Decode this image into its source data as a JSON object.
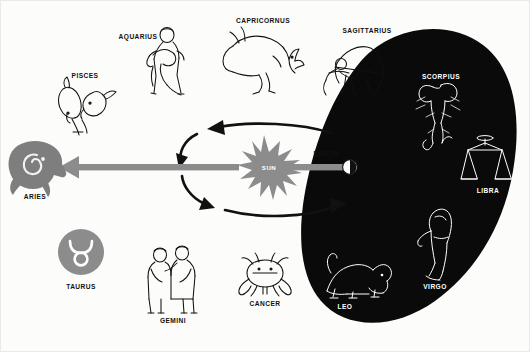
{
  "diagram": {
    "background_color": "#fcfcfb",
    "ink_color": "#111111",
    "accent_gray": "#8c8c8c",
    "night_region_color": "#0a0a0a"
  },
  "center": {
    "sun_label": "SUN",
    "earth_label": "EARTH",
    "sun_color": "#8c8c8c",
    "earth_color_lit": "#ffffff",
    "earth_color_dark": "#111111",
    "sightline_color": "#8c8c8c"
  },
  "night_side": {
    "name": "night-sky-region",
    "fill": "#0a0a0a",
    "label_color": "#ffffff"
  },
  "signs": [
    {
      "id": "aries",
      "label": "ARIES",
      "style": "gray-silhouette",
      "depicts": "ram",
      "region": "day"
    },
    {
      "id": "pisces",
      "label": "PISCES",
      "style": "line-art",
      "depicts": "two-fishes",
      "region": "day"
    },
    {
      "id": "aquarius",
      "label": "AQUARIUS",
      "style": "line-art",
      "depicts": "water-bearer",
      "region": "day"
    },
    {
      "id": "capricornus",
      "label": "CAPRICORNUS",
      "style": "line-art",
      "depicts": "sea-goat",
      "region": "day"
    },
    {
      "id": "sagittarius",
      "label": "SAGITTARIUS",
      "style": "line-art",
      "depicts": "archer",
      "region": "day"
    },
    {
      "id": "scorpius",
      "label": "SCORPIUS",
      "style": "white-line-art",
      "depicts": "scorpion",
      "region": "night"
    },
    {
      "id": "libra",
      "label": "LIBRA",
      "style": "white-line-art",
      "depicts": "scales",
      "region": "night"
    },
    {
      "id": "virgo",
      "label": "VIRGO",
      "style": "white-line-art",
      "depicts": "maiden",
      "region": "night"
    },
    {
      "id": "leo",
      "label": "LEO",
      "style": "white-line-art",
      "depicts": "lion",
      "region": "night"
    },
    {
      "id": "cancer",
      "label": "CANCER",
      "style": "line-art",
      "depicts": "crab",
      "region": "day"
    },
    {
      "id": "gemini",
      "label": "GEMINI",
      "style": "line-art",
      "depicts": "twins",
      "region": "day"
    },
    {
      "id": "taurus",
      "label": "TAURUS",
      "style": "gray-disc-glyph",
      "depicts": "bull-horns",
      "region": "day"
    }
  ]
}
